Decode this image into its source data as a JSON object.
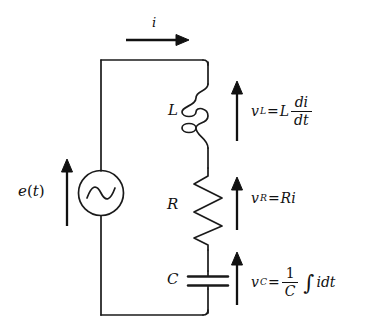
{
  "diagram": {
    "type": "electrical-schematic",
    "stroke_color": "#1a1a1a",
    "background_color": "#ffffff"
  },
  "current": {
    "symbol": "i",
    "direction": "right",
    "position": "above top wire"
  },
  "source": {
    "label_main": "e",
    "label_paren_open": "(",
    "label_var": "t",
    "label_paren_close": ")",
    "symbol": "ac-source",
    "arrow_direction": "up"
  },
  "components": [
    {
      "name": "inductor",
      "label": "L",
      "symbol": "coil",
      "arrow_direction": "up",
      "equation": {
        "lhs_var": "v",
        "lhs_sub": "L",
        "equals": "=",
        "coefficient": "L",
        "numerator": "di",
        "denominator": "dt"
      }
    },
    {
      "name": "resistor",
      "label": "R",
      "symbol": "zigzag",
      "arrow_direction": "up",
      "equation": {
        "lhs_var": "v",
        "lhs_sub": "R",
        "equals": "=",
        "rhs": "Ri"
      }
    },
    {
      "name": "capacitor",
      "label": "C",
      "symbol": "parallel-plates",
      "arrow_direction": "up",
      "equation": {
        "lhs_var": "v",
        "lhs_sub": "C",
        "equals": "=",
        "numerator": "1",
        "denominator": "C",
        "integral": "∫",
        "integrand": "idt"
      }
    }
  ]
}
